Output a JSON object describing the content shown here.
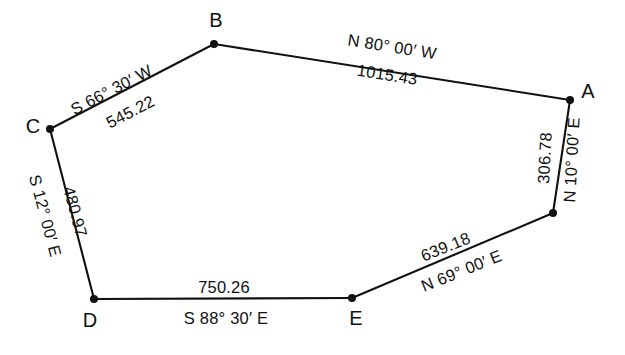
{
  "figure": {
    "type": "surveying-traverse-diagram",
    "background_color": "#ffffff",
    "line_color": "#111111"
  },
  "vertices": [
    {
      "id": "A",
      "label": "A",
      "x": 570,
      "y": 100,
      "label_x": 588,
      "label_y": 93
    },
    {
      "id": "B",
      "label": "B",
      "x": 214,
      "y": 44,
      "label_x": 216,
      "label_y": 22
    },
    {
      "id": "C",
      "label": "C",
      "x": 50,
      "y": 129,
      "label_x": 33,
      "label_y": 128
    },
    {
      "id": "D",
      "label": "D",
      "x": 94,
      "y": 299,
      "label_x": 90,
      "label_y": 322
    },
    {
      "id": "E",
      "label": "E",
      "x": 352,
      "y": 298,
      "label_x": 356,
      "label_y": 320
    },
    {
      "id": "F",
      "label": "",
      "x": 553,
      "y": 213,
      "label_x": 553,
      "label_y": 213
    }
  ],
  "edges": [
    {
      "id": "BA",
      "from": "B",
      "to": "A",
      "bearing": "N 80° 00′ W",
      "distance": "1015.43",
      "bearing_x": 392,
      "bearing_y": 48,
      "distance_x": 387,
      "distance_y": 76,
      "rotation": 9
    },
    {
      "id": "CB",
      "from": "C",
      "to": "B",
      "bearing": "S 66° 30′ W",
      "distance": "545.22",
      "bearing_x": 112,
      "bearing_y": 91,
      "distance_x": 131,
      "distance_y": 113,
      "rotation": -27.5
    },
    {
      "id": "CD",
      "from": "C",
      "to": "D",
      "bearing": "S 12° 00′ E",
      "distance": "480.97",
      "bearing_x": 44,
      "bearing_y": 216,
      "distance_x": 74,
      "distance_y": 212,
      "rotation": 75
    },
    {
      "id": "DE",
      "from": "D",
      "to": "E",
      "bearing": "S 88° 30′ E",
      "distance": "750.26",
      "bearing_x": 226,
      "bearing_y": 320,
      "distance_x": 224,
      "distance_y": 289,
      "rotation": 0
    },
    {
      "id": "EF",
      "from": "E",
      "to": "F",
      "bearing": "N 69° 00′ E",
      "distance": "639.18",
      "bearing_x": 462,
      "bearing_y": 272,
      "distance_x": 446,
      "distance_y": 248,
      "rotation": -22
    },
    {
      "id": "FA",
      "from": "F",
      "to": "A",
      "bearing": "N 10° 00′ E",
      "distance": "306.78",
      "bearing_x": 573,
      "bearing_y": 160,
      "distance_x": 546,
      "distance_y": 158,
      "rotation": -87
    }
  ]
}
